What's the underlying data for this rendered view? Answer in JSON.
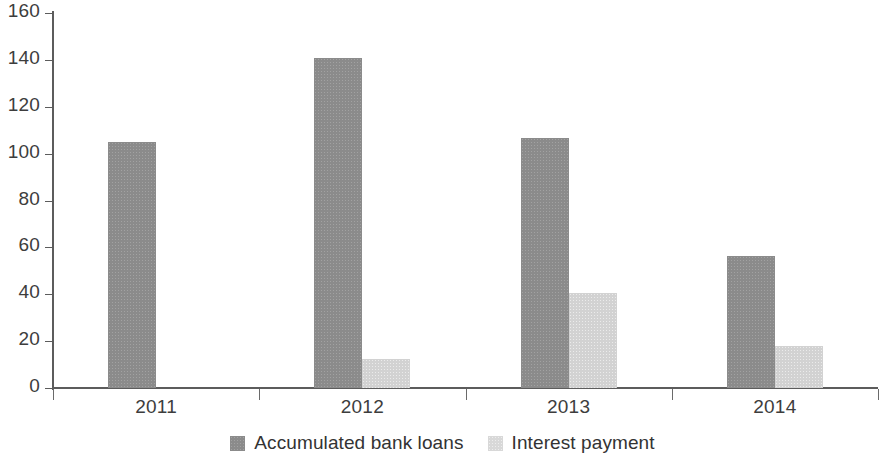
{
  "chart_data": {
    "type": "bar",
    "title": "",
    "subtitle": "",
    "xlabel": "",
    "ylabel": "",
    "categories": [
      "2011",
      "2012",
      "2013",
      "2014"
    ],
    "series": [
      {
        "name": "Accumulated bank loans",
        "color": "#8b8b8b",
        "values": [
          105,
          141,
          106.5,
          56.5
        ]
      },
      {
        "name": "Interest payment",
        "color": "#d2d2d2",
        "values": [
          0,
          12.5,
          40.5,
          18
        ]
      }
    ],
    "ylim": [
      0,
      160
    ],
    "ytick_step": 20,
    "yticks": [
      "0",
      "20",
      "40",
      "60",
      "80",
      "100",
      "120",
      "140",
      "160"
    ],
    "grid": false,
    "legend_position": "bottom",
    "axis_color": "#5c5c5c",
    "text_color": "#3d3d3d",
    "background": "#ffffff"
  },
  "legend": {
    "items": [
      {
        "label": "Accumulated bank loans",
        "swatch": "dark"
      },
      {
        "label": "Interest payment",
        "swatch": "light"
      }
    ]
  }
}
